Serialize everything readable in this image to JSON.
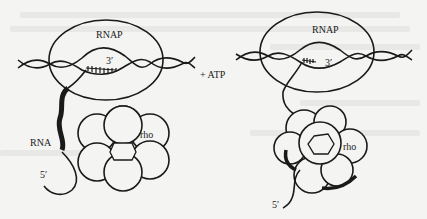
{
  "diagram": {
    "colors": {
      "background": "#f4f4f2",
      "stroke": "#1a1a1a"
    },
    "left_panel": {
      "polymerase_label": "RNAP",
      "rna_3prime_label": "3′",
      "rna_label": "RNA",
      "rna_5prime_label": "5′",
      "rho_label": "rho"
    },
    "transition_label": "+ ATP",
    "right_panel": {
      "polymerase_label": "RNAP",
      "rna_3prime_label": "3′",
      "rna_5prime_label": "5′",
      "rho_label": "rho"
    }
  }
}
